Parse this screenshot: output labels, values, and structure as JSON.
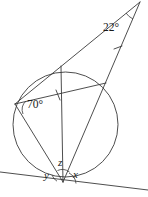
{
  "figure": {
    "stroke_color": "#3a3a3a",
    "text_color": "#1a1a1a",
    "background_color": "#ffffff"
  },
  "labels": {
    "apex_angle": "22°",
    "inscribed_angle": "70°",
    "tangent_angle_z": "z",
    "tangent_angle_x": "x",
    "tangent_angle_y": "y"
  },
  "geometry": {
    "circle": {
      "cx": 65.5,
      "cy": 124.5,
      "r": 52.5
    },
    "points": {
      "apex": {
        "x": 140,
        "y": 2
      },
      "left_vertex": {
        "x": 15,
        "y": 104
      },
      "top_circle_intersection": {
        "x": 61,
        "y": 66
      },
      "right_circle_intersection": {
        "x": 106,
        "y": 83
      },
      "tangent_point": {
        "x": 63,
        "y": 182
      },
      "tangent_line_left": {
        "x": 0,
        "y": 172
      },
      "tangent_line_right": {
        "x": 148,
        "y": 190
      }
    },
    "tick_marks": [
      {
        "x": 58,
        "y": 95,
        "angle": -11
      },
      {
        "x": 118,
        "y": 48,
        "angle": 61
      }
    ]
  }
}
